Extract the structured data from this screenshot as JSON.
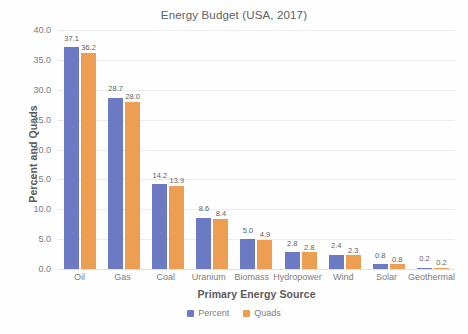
{
  "chart_data": {
    "type": "bar",
    "title": "Energy Budget (USA, 2017)",
    "xlabel": "Primary Energy Source",
    "ylabel": "Percent and Quads",
    "categories": [
      "Oil",
      "Gas",
      "Coal",
      "Uranium",
      "Biomass",
      "Hydropower",
      "Wind",
      "Solar",
      "Geothermal"
    ],
    "series": [
      {
        "name": "Percent",
        "color": "#6C7AC4",
        "values": [
          37.1,
          28.7,
          14.2,
          8.6,
          5.0,
          2.8,
          2.4,
          0.8,
          0.2
        ],
        "labels": [
          "37.1",
          "28.7",
          "14.2",
          "8.6",
          "5.0",
          "2.8",
          "2.4",
          "0.8",
          "0.2"
        ]
      },
      {
        "name": "Quads",
        "color": "#EE9E53",
        "values": [
          36.2,
          28.0,
          13.9,
          8.4,
          4.9,
          2.8,
          2.3,
          0.8,
          0.2
        ],
        "labels": [
          "36.2",
          "28.0",
          "13.9",
          "8.4",
          "4.9",
          "2.8",
          "2.3",
          "0.8",
          "0.2"
        ]
      }
    ],
    "ylim": [
      0.0,
      40.0
    ],
    "ytick_labels": [
      "40.0",
      "35.0",
      "30.0",
      "25.0",
      "20.0",
      "15.0",
      "10.0",
      "5.0",
      "0.0"
    ],
    "ytick_values": [
      40.0,
      35.0,
      30.0,
      25.0,
      20.0,
      15.0,
      10.0,
      5.0,
      0.0
    ],
    "grid": true,
    "legend_position": "bottom",
    "legend_entries": [
      "Percent",
      "Quads"
    ]
  }
}
